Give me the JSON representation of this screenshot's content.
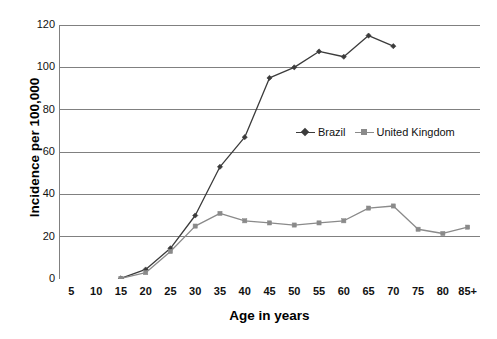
{
  "chart_data": {
    "type": "line",
    "title": "",
    "xlabel": "Age in years",
    "ylabel": "Incidence per 100,000",
    "categories": [
      "5",
      "10",
      "15",
      "20",
      "25",
      "30",
      "35",
      "40",
      "45",
      "50",
      "55",
      "60",
      "65",
      "70",
      "75",
      "80",
      "85+"
    ],
    "ylim": [
      0,
      120
    ],
    "yticks": [
      0,
      20,
      40,
      60,
      80,
      100,
      120
    ],
    "grid": "horizontal",
    "legend_position": "inside-right-middle",
    "series": [
      {
        "name": "Brazil",
        "color": "#3b3b3b",
        "marker": "diamond",
        "values": [
          null,
          null,
          0.3,
          4.5,
          14.5,
          30,
          53,
          67,
          95,
          100,
          107.5,
          105,
          115,
          110,
          null,
          null,
          null
        ]
      },
      {
        "name": "United Kingdom",
        "color": "#8a8a8a",
        "marker": "square",
        "values": [
          null,
          null,
          0.3,
          3,
          13,
          25,
          31,
          27.5,
          26.5,
          25.5,
          26.5,
          27.5,
          33.5,
          34.5,
          23.5,
          21.5,
          24.5
        ]
      }
    ]
  },
  "axes": {
    "y_tick_labels": [
      "0",
      "20",
      "40",
      "60",
      "80",
      "100",
      "120"
    ],
    "x_tick_labels": [
      "5",
      "10",
      "15",
      "20",
      "25",
      "30",
      "35",
      "40",
      "45",
      "50",
      "55",
      "60",
      "65",
      "70",
      "75",
      "80",
      "85+"
    ],
    "y_title": "Incidence per 100,000",
    "x_title": "Age in years"
  },
  "legend": {
    "items": [
      {
        "label": "Brazil",
        "marker": "diamond-marker",
        "color": "#3b3b3b"
      },
      {
        "label": "United Kingdom",
        "marker": "square-marker",
        "color": "#8a8a8a"
      }
    ]
  },
  "style": {
    "axis_color": "#808080",
    "grid_color": "#808080",
    "background": "#ffffff",
    "text_color": "#111111"
  }
}
